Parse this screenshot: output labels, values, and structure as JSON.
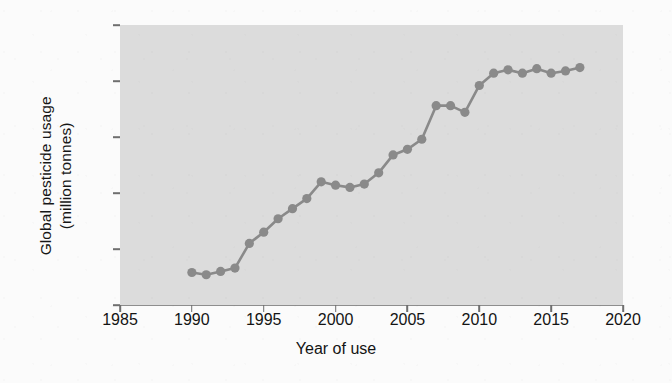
{
  "chart_data": {
    "type": "line",
    "title": "",
    "xlabel": "Year of use",
    "ylabel": "Global pesticide usage (million tonnes)",
    "ylabel_line1": "Global pesticide usage",
    "ylabel_line2": "(million tonnes)",
    "xlim": [
      1985,
      2020
    ],
    "ylim": [
      2,
      4.5
    ],
    "xticks": [
      1985,
      1990,
      1995,
      2000,
      2005,
      2010,
      2015,
      2020
    ],
    "xtick_labels": [
      "1985",
      "1990",
      "1995",
      "2000",
      "2005",
      "2010",
      "2015",
      "2020"
    ],
    "yticks": [
      2,
      2.5,
      3,
      3.5,
      4,
      4.5
    ],
    "ytick_labels": [
      "2",
      "2.5",
      "3",
      "3.5",
      "4",
      "4.5"
    ],
    "grid": false,
    "legend": false,
    "markers": true,
    "marker_shape": "circle",
    "series_color": "#8a8a8a",
    "plot_background": "#dcdcdc",
    "figure_background": "#fbfbfb",
    "x": [
      1990,
      1991,
      1992,
      1993,
      1994,
      1995,
      1996,
      1997,
      1998,
      1999,
      2000,
      2001,
      2002,
      2003,
      2004,
      2005,
      2006,
      2007,
      2008,
      2009,
      2010,
      2011,
      2012,
      2013,
      2014,
      2015,
      2016,
      2017
    ],
    "series": [
      {
        "name": "Global pesticide usage",
        "values": [
          2.29,
          2.27,
          2.3,
          2.33,
          2.55,
          2.65,
          2.77,
          2.86,
          2.95,
          3.1,
          3.07,
          3.05,
          3.08,
          3.18,
          3.34,
          3.39,
          3.48,
          3.78,
          3.78,
          3.72,
          3.96,
          4.07,
          4.1,
          4.07,
          4.11,
          4.07,
          4.09,
          4.12
        ]
      }
    ]
  }
}
